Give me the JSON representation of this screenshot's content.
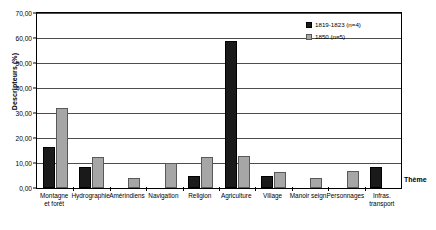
{
  "chart_data": {
    "type": "bar",
    "title": "",
    "xlabel": "Thème",
    "ylabel": "Descripteurs (%)",
    "ylim": [
      0,
      70
    ],
    "yticks": [
      "0,00",
      "10,00",
      "20,00",
      "30,00",
      "40,00",
      "50,00",
      "60,00",
      "70,00"
    ],
    "ytick_values": [
      0,
      10,
      20,
      30,
      40,
      50,
      60,
      70
    ],
    "grid": true,
    "legend_position": "top-right",
    "categories": [
      "Montagne et forêt",
      "Hydrographie",
      "Amérindiens",
      "Navigation",
      "Religion",
      "Agriculture",
      "Village",
      "Manoir seign.",
      "Personnages",
      "Infras. transport"
    ],
    "category_lines": [
      [
        "Montagne",
        "et forêt"
      ],
      [
        "Hydrographie"
      ],
      [
        "Amérindiens"
      ],
      [
        "Navigation"
      ],
      [
        "Religion"
      ],
      [
        "Agriculture"
      ],
      [
        "Village"
      ],
      [
        "Manoir seign."
      ],
      [
        "Personnages"
      ],
      [
        "Infras.",
        "transport"
      ]
    ],
    "series": [
      {
        "name": "1819-1823 (n=4)",
        "color": "#1a1a1a",
        "values": [
          16.5,
          8.5,
          0,
          0,
          5.0,
          59.0,
          5.0,
          0,
          0,
          8.5
        ]
      },
      {
        "name": "1850 (n=5)",
        "color": "#a6a6a6",
        "values": [
          32.0,
          12.5,
          4.0,
          10.0,
          12.5,
          13.0,
          6.5,
          4.0,
          7.0,
          0
        ]
      }
    ]
  },
  "legend": {
    "items": [
      {
        "label": "1819-1823 (n=4)"
      },
      {
        "label": "1850 (n=5)"
      }
    ]
  }
}
